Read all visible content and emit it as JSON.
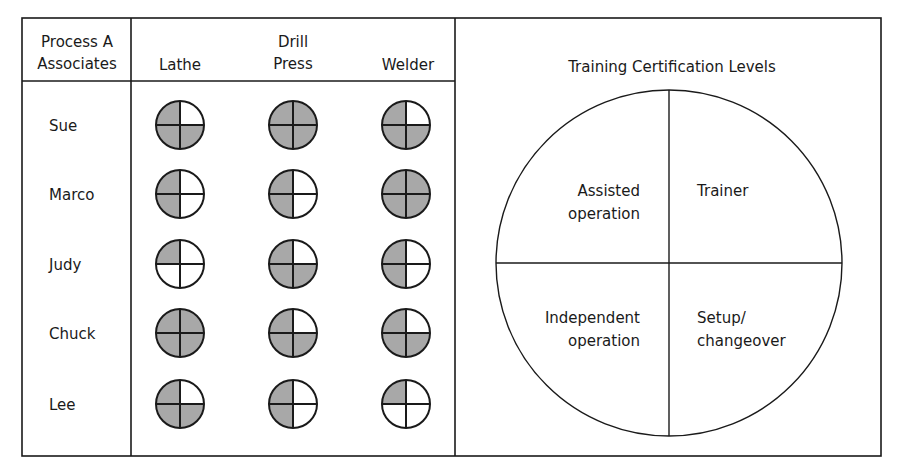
{
  "table": {
    "header": {
      "associates_line1": "Process A",
      "associates_line2": "Associates",
      "columns": [
        {
          "lines": [
            "Lathe"
          ]
        },
        {
          "lines": [
            "Drill",
            "Press"
          ]
        },
        {
          "lines": [
            "Welder"
          ]
        }
      ]
    },
    "rows": [
      {
        "name": "Sue",
        "cells": [
          {
            "tl": 1,
            "tr": 0,
            "bl": 1,
            "br": 1
          },
          {
            "tl": 1,
            "tr": 1,
            "bl": 1,
            "br": 1
          },
          {
            "tl": 1,
            "tr": 0,
            "bl": 1,
            "br": 1
          }
        ]
      },
      {
        "name": "Marco",
        "cells": [
          {
            "tl": 1,
            "tr": 0,
            "bl": 1,
            "br": 0
          },
          {
            "tl": 1,
            "tr": 0,
            "bl": 1,
            "br": 0
          },
          {
            "tl": 1,
            "tr": 1,
            "bl": 1,
            "br": 1
          }
        ]
      },
      {
        "name": "Judy",
        "cells": [
          {
            "tl": 1,
            "tr": 0,
            "bl": 0,
            "br": 0
          },
          {
            "tl": 1,
            "tr": 0,
            "bl": 1,
            "br": 1
          },
          {
            "tl": 1,
            "tr": 0,
            "bl": 1,
            "br": 0
          }
        ]
      },
      {
        "name": "Chuck",
        "cells": [
          {
            "tl": 1,
            "tr": 1,
            "bl": 1,
            "br": 1
          },
          {
            "tl": 1,
            "tr": 0,
            "bl": 1,
            "br": 1
          },
          {
            "tl": 1,
            "tr": 0,
            "bl": 1,
            "br": 1
          }
        ]
      },
      {
        "name": "Lee",
        "cells": [
          {
            "tl": 1,
            "tr": 0,
            "bl": 1,
            "br": 1
          },
          {
            "tl": 1,
            "tr": 0,
            "bl": 1,
            "br": 0
          },
          {
            "tl": 1,
            "tr": 0,
            "bl": 0,
            "br": 0
          }
        ]
      }
    ]
  },
  "legend": {
    "title": "Training Certification Levels",
    "quadrants": {
      "top_left": [
        "Assisted",
        "operation"
      ],
      "top_right": [
        "Trainer"
      ],
      "bottom_left": [
        "Independent",
        "operation"
      ],
      "bottom_right": [
        "Setup/",
        "changeover"
      ]
    }
  },
  "colors": {
    "line": "#1a1a1a",
    "fill": "#a8a8a8",
    "background": "#ffffff"
  }
}
